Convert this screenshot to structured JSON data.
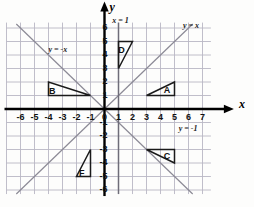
{
  "chart_data": {
    "type": "scatter",
    "title": "",
    "xlabel": "x",
    "ylabel": "y",
    "xlim": [
      -6.6,
      7.6
    ],
    "ylim": [
      -6.4,
      6.4
    ],
    "grid": true,
    "legend": "none",
    "x_ticks": [
      "-6",
      "-5",
      "-4",
      "-3",
      "-2",
      "-1",
      "0",
      "1",
      "2",
      "3",
      "4",
      "5",
      "6",
      "7"
    ],
    "x_tick_values": [
      -6,
      -5,
      -4,
      -3,
      -2,
      -1,
      0,
      1,
      2,
      3,
      4,
      5,
      6,
      7
    ],
    "y_ticks": [
      "6",
      "5",
      "4",
      "3",
      "2",
      "1",
      "-1",
      "-2",
      "-3",
      "-4",
      "-5",
      "-6"
    ],
    "y_tick_values": [
      6,
      5,
      4,
      3,
      2,
      1,
      -1,
      -2,
      -3,
      -4,
      -5,
      -6
    ],
    "lines": [
      {
        "name": "y = x",
        "label": "y = x",
        "equation": "y=x",
        "slope": 1,
        "intercept": 0,
        "from": [
          -6.3,
          -6.3
        ],
        "to": [
          6.3,
          6.3
        ]
      },
      {
        "name": "y = -x",
        "label": "y = -x",
        "equation": "y=-x",
        "slope": -1,
        "intercept": 0,
        "from": [
          -6.3,
          6.3
        ],
        "to": [
          6.3,
          -6.3
        ]
      },
      {
        "name": "x = 1",
        "label": "x = 1",
        "equation": "x=1",
        "from": [
          1,
          -6.3
        ],
        "to": [
          1,
          6.3
        ]
      },
      {
        "name": "y = -1",
        "label": "y = -1",
        "equation": "y=-1",
        "from": null,
        "to": null
      }
    ],
    "shapes": [
      {
        "label": "A",
        "type": "triangle",
        "vertices": [
          [
            3,
            1
          ],
          [
            5,
            1
          ],
          [
            5,
            2
          ]
        ],
        "label_pos": [
          4.45,
          1.35
        ]
      },
      {
        "label": "B",
        "type": "triangle",
        "vertices": [
          [
            -4,
            2
          ],
          [
            -4,
            1
          ],
          [
            -1,
            1
          ]
        ],
        "label_pos": [
          -3.75,
          1.3
        ]
      },
      {
        "label": "C",
        "type": "triangle",
        "vertices": [
          [
            3,
            -3
          ],
          [
            5,
            -3
          ],
          [
            5,
            -4
          ]
        ],
        "label_pos": [
          4.45,
          -3.55
        ]
      },
      {
        "label": "D",
        "type": "triangle",
        "vertices": [
          [
            1,
            3
          ],
          [
            1,
            5
          ],
          [
            2,
            5
          ]
        ],
        "label_pos": [
          1.2,
          4.35
        ]
      },
      {
        "label": "F",
        "type": "triangle",
        "vertices": [
          [
            -1,
            -3
          ],
          [
            -1,
            -5
          ],
          [
            -2,
            -5
          ]
        ],
        "label_pos": [
          -1.6,
          -4.75
        ]
      }
    ],
    "annotations": [
      {
        "text": "y = x",
        "x": 5.6,
        "y": 6.15
      },
      {
        "text": "y = -x",
        "x": -4.0,
        "y": 4.35
      },
      {
        "text": "x = 1",
        "x": 0.55,
        "y": 6.5
      },
      {
        "text": "y = -1",
        "x": 5.3,
        "y": -1.45
      }
    ],
    "colors": {
      "grid": "#b9b7c4",
      "axis": "#000000",
      "line": "#8c8a96",
      "shape_stroke": "#1a1a1a",
      "background": "#fdfdfc",
      "text": "#111111"
    }
  },
  "axis_titles": {
    "x": "x",
    "y": "y"
  },
  "tick_labels": {
    "x": [
      "-6",
      "-5",
      "-4",
      "-3",
      "-2",
      "-1",
      "0",
      "1",
      "2",
      "3",
      "4",
      "5",
      "6",
      "7"
    ],
    "y": [
      "6",
      "5",
      "4",
      "3",
      "2",
      "1",
      "-1",
      "-2",
      "-3",
      "-4",
      "-5",
      "-6"
    ]
  },
  "shape_labels": {
    "a": "A",
    "b": "B",
    "c": "C",
    "d": "D",
    "f": "F"
  },
  "line_labels": {
    "y_equals_x": "y = x",
    "y_equals_neg_x": "y = -x",
    "x_equals_1": "x = 1",
    "y_equals_neg_1": "y = -1"
  }
}
